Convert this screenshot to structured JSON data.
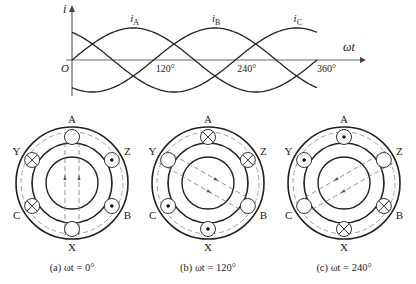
{
  "waveform": {
    "y_axis_label": "i",
    "x_axis_label": "ωt",
    "origin_label": "O",
    "ticks": [
      {
        "deg": 120,
        "label": "120°"
      },
      {
        "deg": 240,
        "label": "240°"
      },
      {
        "deg": 360,
        "label": "360°"
      }
    ],
    "series": [
      {
        "name": "iA",
        "label_main": "i",
        "label_sub": "A",
        "phase_deg": 0,
        "label_at_deg": 90
      },
      {
        "name": "iB",
        "label_main": "i",
        "label_sub": "B",
        "phase_deg": -120,
        "label_at_deg": 210
      },
      {
        "name": "iC",
        "label_main": "i",
        "label_sub": "C",
        "phase_deg": 120,
        "label_at_deg": 330
      }
    ],
    "x_range_deg": [
      0,
      360
    ]
  },
  "motors": [
    {
      "caption": "(a) ωt = 0°",
      "field_axis_deg": 90,
      "slots": [
        {
          "name": "A",
          "angle": 90,
          "state": "empty"
        },
        {
          "name": "Z",
          "angle": 30,
          "state": "dot"
        },
        {
          "name": "B",
          "angle": -30,
          "state": "dot"
        },
        {
          "name": "X",
          "angle": -90,
          "state": "empty"
        },
        {
          "name": "C",
          "angle": -150,
          "state": "cross"
        },
        {
          "name": "Y",
          "angle": 150,
          "state": "cross"
        }
      ]
    },
    {
      "caption": "(b) ωt = 120°",
      "field_axis_deg": -30,
      "slots": [
        {
          "name": "A",
          "angle": 90,
          "state": "cross"
        },
        {
          "name": "Z",
          "angle": 30,
          "state": "cross"
        },
        {
          "name": "B",
          "angle": -30,
          "state": "empty"
        },
        {
          "name": "X",
          "angle": -90,
          "state": "dot"
        },
        {
          "name": "C",
          "angle": -150,
          "state": "dot"
        },
        {
          "name": "Y",
          "angle": 150,
          "state": "empty"
        }
      ]
    },
    {
      "caption": "(c) ωt = 240°",
      "field_axis_deg": 210,
      "slots": [
        {
          "name": "A",
          "angle": 90,
          "state": "dot"
        },
        {
          "name": "Z",
          "angle": 30,
          "state": "empty"
        },
        {
          "name": "B",
          "angle": -30,
          "state": "cross"
        },
        {
          "name": "X",
          "angle": -90,
          "state": "cross"
        },
        {
          "name": "C",
          "angle": -150,
          "state": "empty"
        },
        {
          "name": "Y",
          "angle": 150,
          "state": "dot"
        }
      ]
    }
  ]
}
